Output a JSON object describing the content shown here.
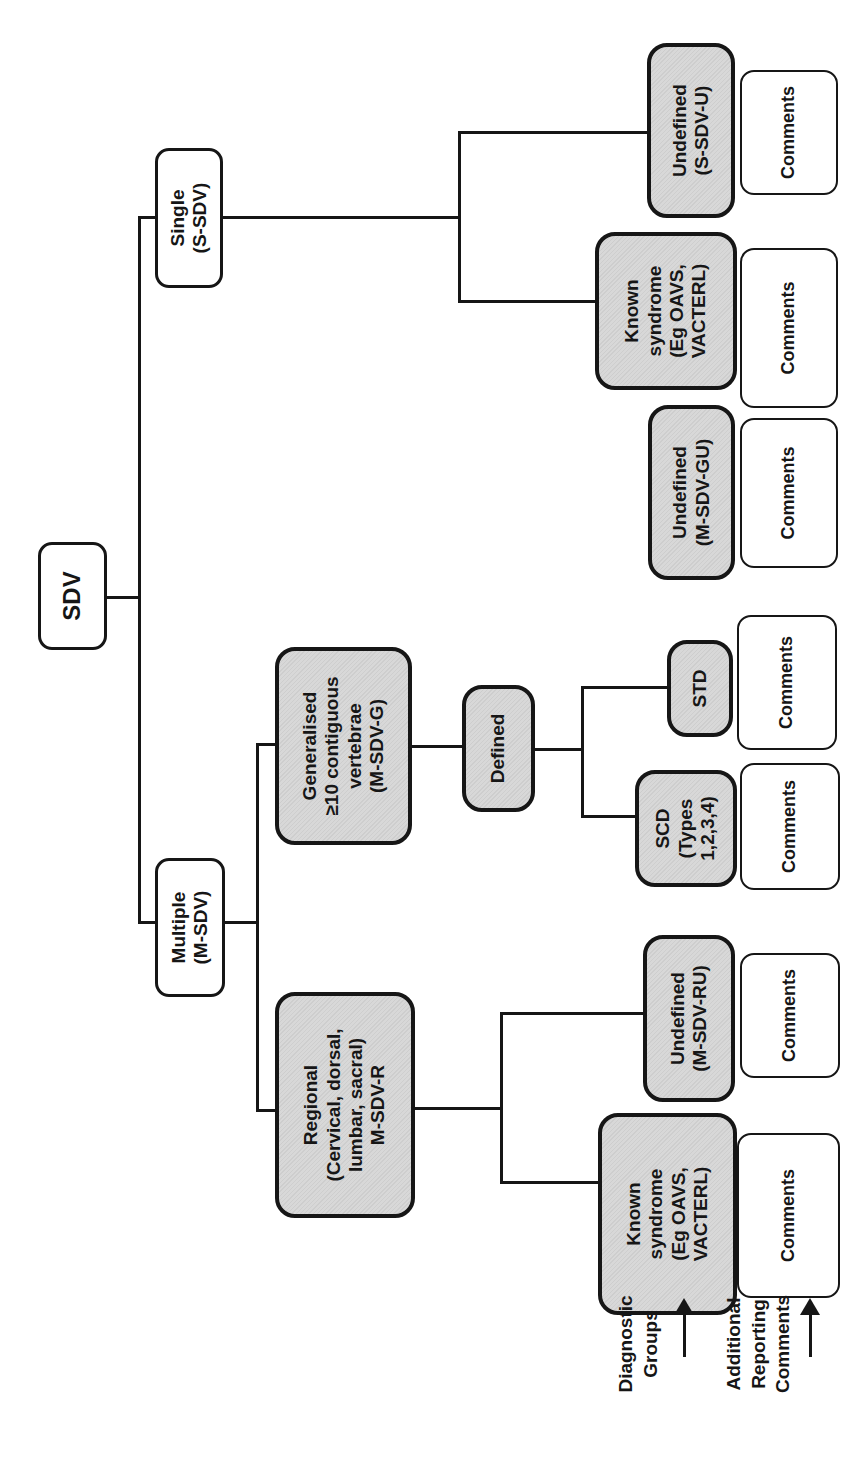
{
  "colors": {
    "box_border": "#161616",
    "gray_fill": "#d8d8d8",
    "white_fill": "#ffffff",
    "connector": "#161616"
  },
  "nodes": {
    "root": {
      "label": "SDV"
    },
    "single": {
      "label": "Single\n(S-SDV)"
    },
    "multiple": {
      "label": "Multiple\n(M-SDV)"
    },
    "regional": {
      "label": "Regional\n(Cervical, dorsal,\nlumbar, sacral)\nM-SDV-R"
    },
    "generalised": {
      "label": "Generalised\n≥10 contiguous\nvertebrae\n(M-SDV-G)"
    },
    "defined": {
      "label": "Defined"
    },
    "known_syndrome_regional": {
      "label": "Known\nsyndrome\n(Eg OAVS,\nVACTERL)"
    },
    "undefined_regional": {
      "label": "Undefined\n(M-SDV-RU)"
    },
    "scd": {
      "label": "SCD\n(Types\n1,2,3,4)"
    },
    "std": {
      "label": "STD"
    },
    "undefined_generalised": {
      "label": "Undefined\n(M-SDV-GU)"
    },
    "known_syndrome_single": {
      "label": "Known\nsyndrome\n(Eg OAVS,\nVACTERL)"
    },
    "undefined_single": {
      "label": "Undefined\n(S-SDV-U)"
    }
  },
  "labels": {
    "comments": "Comments",
    "diagnostic_groups": "Diagnostic\nGroups",
    "additional_reporting": "Additional\nReporting\nComments"
  }
}
